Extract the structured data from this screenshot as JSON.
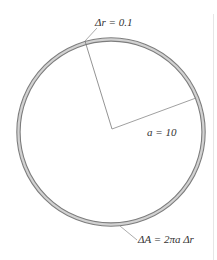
{
  "diagram": {
    "ring": {
      "center": [
        111,
        132
      ],
      "outer_radius": 94,
      "inner_radius": 91,
      "stroke_color": "#7a7a7a",
      "fill_color": "#d0d0d0"
    },
    "labels": {
      "delta_r": "Δr = 0.1",
      "radius": "a = 10",
      "delta_area": "ΔA = 2πa Δr"
    },
    "values": {
      "delta_r": 0.1,
      "a": 10
    },
    "right_border_color": "#e6e6e6"
  }
}
